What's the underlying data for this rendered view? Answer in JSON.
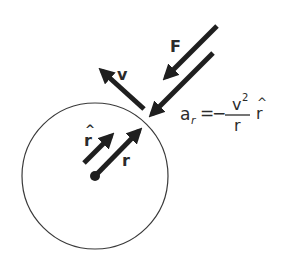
{
  "diagram": {
    "colors": {
      "stroke": "#1f1f1f",
      "text": "#2b2b2b",
      "background": "#ffffff"
    },
    "circle": {
      "cx": 95,
      "cy": 176,
      "r": 73
    },
    "labels": {
      "force": "F",
      "velocity": "v",
      "radius": "r",
      "unit_radius": "r",
      "unit_hat": "^",
      "accel_lhs_base": "a",
      "accel_lhs_sub": "r",
      "equals": "=",
      "minus": "−",
      "numerator_base": "v",
      "numerator_exp": "2",
      "denominator": "r",
      "rhs_unit": "r",
      "rhs_hat": "^"
    },
    "arrows": [
      {
        "name": "force-arrow",
        "label": "F"
      },
      {
        "name": "acceleration-arrow",
        "label": "a_r"
      },
      {
        "name": "velocity-arrow",
        "label": "v"
      },
      {
        "name": "radius-arrow",
        "label": "r"
      },
      {
        "name": "unit-radius-arrow",
        "label": "r-hat"
      }
    ],
    "equation": "a_r = − v^2 / r r̂"
  }
}
